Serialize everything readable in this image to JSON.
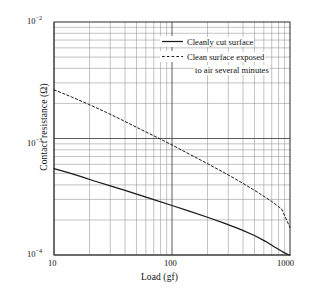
{
  "chart_data": {
    "type": "line",
    "title": "",
    "xlabel": "Load (gf)",
    "ylabel": "Contact resistance (Ω)",
    "xscale": "log",
    "yscale": "log",
    "xlim": [
      10,
      1000
    ],
    "ylim": [
      0.0001,
      0.01
    ],
    "grid": "both-major-and-minor",
    "legend_position": "top-right-inside",
    "xticks": [
      {
        "value": 10,
        "label": "10"
      },
      {
        "value": 100,
        "label": "100"
      },
      {
        "value": 1000,
        "label": "1000"
      }
    ],
    "yticks": [
      {
        "value": 0.01,
        "label": "10",
        "exponent": "−2"
      },
      {
        "value": 0.001,
        "label": "10",
        "exponent": "−3"
      },
      {
        "value": 0.0001,
        "label": "10",
        "exponent": "−4"
      }
    ],
    "series": [
      {
        "name": "Cleanly cut surface",
        "style": "solid",
        "color": "#1a1a1a",
        "points": [
          {
            "x": 10,
            "y": 0.000552
          },
          {
            "x": 13,
            "y": 0.000512
          },
          {
            "x": 17,
            "y": 0.00047
          },
          {
            "x": 22,
            "y": 0.000432
          },
          {
            "x": 30,
            "y": 0.000392
          },
          {
            "x": 40,
            "y": 0.000358
          },
          {
            "x": 55,
            "y": 0.000323
          },
          {
            "x": 70,
            "y": 0.000299
          },
          {
            "x": 100,
            "y": 0.000266
          },
          {
            "x": 140,
            "y": 0.000238
          },
          {
            "x": 200,
            "y": 0.000211
          },
          {
            "x": 280,
            "y": 0.000187
          },
          {
            "x": 380,
            "y": 0.000166
          },
          {
            "x": 500,
            "y": 0.000147
          },
          {
            "x": 620,
            "y": 0.000131
          },
          {
            "x": 740,
            "y": 0.000117
          },
          {
            "x": 860,
            "y": 0.000107
          },
          {
            "x": 960,
            "y": 0.000101
          },
          {
            "x": 1000,
            "y": 0.0001
          }
        ]
      },
      {
        "name": "Clean surface exposed to air several minutes",
        "style": "dashed",
        "color": "#1a1a1a",
        "points": [
          {
            "x": 10,
            "y": 0.00262
          },
          {
            "x": 14,
            "y": 0.00228
          },
          {
            "x": 20,
            "y": 0.00195
          },
          {
            "x": 28,
            "y": 0.00167
          },
          {
            "x": 40,
            "y": 0.0014
          },
          {
            "x": 55,
            "y": 0.00119
          },
          {
            "x": 75,
            "y": 0.00102
          },
          {
            "x": 100,
            "y": 0.00088
          },
          {
            "x": 140,
            "y": 0.000735
          },
          {
            "x": 200,
            "y": 0.000608
          },
          {
            "x": 280,
            "y": 0.000506
          },
          {
            "x": 400,
            "y": 0.000412
          },
          {
            "x": 550,
            "y": 0.000338
          },
          {
            "x": 700,
            "y": 0.000288
          },
          {
            "x": 850,
            "y": 0.000248
          },
          {
            "x": 1000,
            "y": 0.000172
          }
        ]
      }
    ]
  },
  "legend": {
    "entries": [
      {
        "label": "Cleanly cut surface",
        "style": "solid"
      },
      {
        "label": "Clean surface exposed",
        "style": "dashed"
      },
      {
        "label": "to air several minutes",
        "style": "continuation"
      }
    ]
  },
  "axes": {
    "x_title": "Load (gf)",
    "y_title": "Contact resistance (Ω)",
    "x_tick_labels": [
      "10",
      "100",
      "1000"
    ],
    "y_tick_mantissa": "10",
    "y_tick_exponents": [
      "−2",
      "−3",
      "−4"
    ]
  },
  "colors": {
    "ink": "#1a1a1a",
    "major_grid": "#4a4a4a",
    "minor_grid": "#9a9a9a",
    "background": "#ffffff"
  }
}
